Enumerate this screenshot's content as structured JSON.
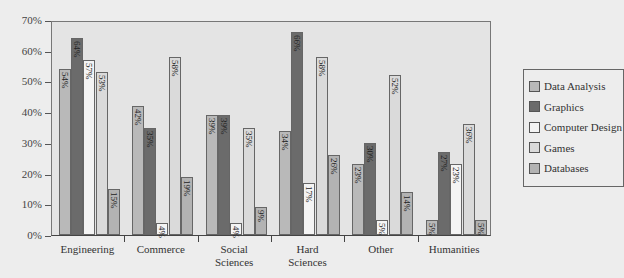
{
  "chart_data": {
    "type": "bar",
    "title": "",
    "xlabel": "",
    "ylabel": "",
    "ylim": [
      0,
      70
    ],
    "yticks": [
      "0%",
      "10%",
      "20%",
      "30%",
      "40%",
      "50%",
      "60%",
      "70%"
    ],
    "grid": false,
    "legend_position": "right",
    "categories": [
      "Engineering",
      "Commerce",
      "Social Sciences",
      "Hard Sciences",
      "Other",
      "Humanities"
    ],
    "category_lines": [
      [
        "Engineering"
      ],
      [
        "Commerce"
      ],
      [
        "Social",
        "Sciences"
      ],
      [
        "Hard",
        "Sciences"
      ],
      [
        "Other"
      ],
      [
        "Humanities"
      ]
    ],
    "series": [
      {
        "name": "Data Analysis",
        "color": "#b9b9b9",
        "values": [
          54,
          42,
          39,
          34,
          23,
          5
        ]
      },
      {
        "name": "Graphics",
        "color": "#6b6b6b",
        "values": [
          64,
          35,
          39,
          66,
          30,
          27
        ]
      },
      {
        "name": "Computer Design",
        "color": "#f4f4f4",
        "values": [
          57,
          4,
          4,
          17,
          5,
          23
        ]
      },
      {
        "name": "Games",
        "color": "#dadada",
        "values": [
          53,
          58,
          35,
          58,
          52,
          36
        ]
      },
      {
        "name": "Databases",
        "color": "#b3b3b3",
        "values": [
          15,
          19,
          9,
          26,
          14,
          5
        ]
      }
    ]
  }
}
